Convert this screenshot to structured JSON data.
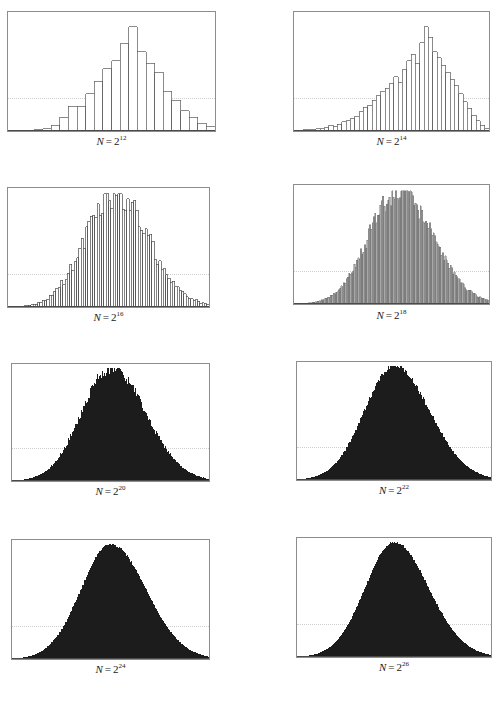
{
  "figure": {
    "type": "multi-panel-histogram-grid",
    "rows": 4,
    "cols": 2,
    "panel_count": 8,
    "background_color": "#ffffff",
    "frame_color": "#8d8d8d",
    "refline_color": "#cfcfcf",
    "refline_style": "dotted"
  },
  "chart_data": [
    {
      "type": "bar",
      "title": "N = 2^12",
      "label_prefix": "N",
      "label_equals": "=",
      "label_base": "2",
      "label_exponent": "12",
      "n_value": 4096,
      "xlabel": "",
      "ylabel": "",
      "grid": false,
      "legend": "none",
      "bar_fill": "#ffffff",
      "bar_stroke": "#5a5a5a",
      "bar_count": 24,
      "refline_y_frac": 0.72,
      "xlim": [
        0,
        24
      ],
      "ylim": [
        0,
        1
      ],
      "categories": [
        "0",
        "1",
        "2",
        "3",
        "4",
        "5",
        "6",
        "7",
        "8",
        "9",
        "10",
        "11",
        "12",
        "13",
        "14",
        "15",
        "16",
        "17",
        "18",
        "19",
        "20",
        "21",
        "22",
        "23"
      ],
      "values": [
        0.0,
        0.0,
        0.0,
        0.01,
        0.02,
        0.05,
        0.12,
        0.22,
        0.22,
        0.33,
        0.44,
        0.55,
        0.62,
        0.77,
        0.92,
        0.7,
        0.6,
        0.52,
        0.35,
        0.27,
        0.18,
        0.12,
        0.07,
        0.04
      ]
    },
    {
      "type": "bar",
      "title": "N = 2^14",
      "label_prefix": "N",
      "label_equals": "=",
      "label_base": "2",
      "label_exponent": "14",
      "n_value": 16384,
      "xlabel": "",
      "ylabel": "",
      "grid": false,
      "legend": "none",
      "bar_fill": "#ffffff",
      "bar_stroke": "#5a5a5a",
      "bar_count": 45,
      "refline_y_frac": 0.72,
      "xlim": [
        0,
        45
      ],
      "ylim": [
        0,
        1
      ],
      "values": [
        0.0,
        0.0,
        0.01,
        0.01,
        0.01,
        0.02,
        0.02,
        0.03,
        0.05,
        0.04,
        0.06,
        0.08,
        0.09,
        0.11,
        0.13,
        0.17,
        0.21,
        0.23,
        0.27,
        0.31,
        0.35,
        0.38,
        0.42,
        0.48,
        0.43,
        0.54,
        0.62,
        0.68,
        0.6,
        0.78,
        0.92,
        0.83,
        0.7,
        0.65,
        0.58,
        0.52,
        0.46,
        0.4,
        0.33,
        0.26,
        0.2,
        0.14,
        0.09,
        0.05,
        0.02
      ]
    },
    {
      "type": "bar",
      "title": "N = 2^16",
      "label_prefix": "N",
      "label_equals": "=",
      "label_base": "2",
      "label_exponent": "16",
      "n_value": 65536,
      "xlabel": "",
      "ylabel": "",
      "grid": false,
      "legend": "none",
      "bar_fill": "#ffffff",
      "bar_stroke": "#4a4a4a",
      "bar_count": 88,
      "refline_y_frac": 0.72,
      "xlim": [
        0,
        88
      ],
      "ylim": [
        0,
        1
      ],
      "distribution": "right-skewed-normal-like",
      "peak_position_frac": 0.52,
      "peak_value": 1.0
    },
    {
      "type": "bar",
      "title": "N = 2^18",
      "label_prefix": "N",
      "label_equals": "=",
      "label_base": "2",
      "label_exponent": "18",
      "n_value": 262144,
      "xlabel": "",
      "ylabel": "",
      "grid": false,
      "legend": "none",
      "bar_fill": "#a8a8a8",
      "bar_stroke": "#6a6a6a",
      "bar_count": 150,
      "refline_y_frac": 0.72,
      "xlim": [
        0,
        150
      ],
      "ylim": [
        0,
        1
      ],
      "distribution": "right-skewed-normal-like",
      "peak_position_frac": 0.53,
      "peak_value": 1.0
    },
    {
      "type": "bar",
      "title": "N = 2^20",
      "label_prefix": "N",
      "label_equals": "=",
      "label_base": "2",
      "label_exponent": "20",
      "n_value": 1048576,
      "xlabel": "",
      "ylabel": "",
      "grid": false,
      "legend": "none",
      "bar_fill": "#1c1c1c",
      "bar_stroke": "#1c1c1c",
      "bar_count": 220,
      "refline_y_frac": 0.72,
      "xlim": [
        0,
        220
      ],
      "ylim": [
        0,
        1
      ],
      "distribution": "normal-with-jagged-peak",
      "peak_position_frac": 0.5,
      "peak_value": 1.0
    },
    {
      "type": "bar",
      "title": "N = 2^22",
      "label_prefix": "N",
      "label_equals": "=",
      "label_base": "2",
      "label_exponent": "22",
      "n_value": 4194304,
      "xlabel": "",
      "ylabel": "",
      "grid": false,
      "legend": "none",
      "bar_fill": "#1c1c1c",
      "bar_stroke": "#1c1c1c",
      "bar_count": 260,
      "refline_y_frac": 0.72,
      "xlim": [
        0,
        260
      ],
      "ylim": [
        0,
        1
      ],
      "distribution": "normal-smooth",
      "peak_position_frac": 0.5,
      "peak_value": 1.0
    },
    {
      "type": "bar",
      "title": "N = 2^24",
      "label_prefix": "N",
      "label_equals": "=",
      "label_base": "2",
      "label_exponent": "24",
      "n_value": 16777216,
      "xlabel": "",
      "ylabel": "",
      "grid": false,
      "legend": "none",
      "bar_fill": "#1c1c1c",
      "bar_stroke": "#1c1c1c",
      "bar_count": 300,
      "refline_y_frac": 0.72,
      "xlim": [
        0,
        300
      ],
      "ylim": [
        0,
        1
      ],
      "distribution": "normal-smooth",
      "peak_position_frac": 0.5,
      "peak_value": 1.0
    },
    {
      "type": "bar",
      "title": "N = 2^26",
      "label_prefix": "N",
      "label_equals": "=",
      "label_base": "2",
      "label_exponent": "26",
      "n_value": 67108864,
      "xlabel": "",
      "ylabel": "",
      "grid": false,
      "legend": "none",
      "bar_fill": "#1c1c1c",
      "bar_stroke": "#1c1c1c",
      "bar_count": 320,
      "refline_y_frac": 0.72,
      "xlim": [
        0,
        320
      ],
      "ylim": [
        0,
        1
      ],
      "distribution": "normal-smooth",
      "peak_position_frac": 0.5,
      "peak_value": 1.0
    }
  ],
  "panels": [
    {
      "x": 7,
      "y": 11,
      "w": 209,
      "h": 121,
      "caption_y": 134
    },
    {
      "x": 293,
      "y": 11,
      "w": 197,
      "h": 121,
      "caption_y": 134
    },
    {
      "x": 7,
      "y": 187,
      "w": 203,
      "h": 121,
      "caption_y": 310
    },
    {
      "x": 293,
      "y": 184,
      "w": 197,
      "h": 121,
      "caption_y": 308
    },
    {
      "x": 11,
      "y": 363,
      "w": 199,
      "h": 119,
      "caption_y": 484
    },
    {
      "x": 296,
      "y": 361,
      "w": 196,
      "h": 120,
      "caption_y": 483
    },
    {
      "x": 11,
      "y": 539,
      "w": 199,
      "h": 121,
      "caption_y": 662
    },
    {
      "x": 296,
      "y": 537,
      "w": 196,
      "h": 121,
      "caption_y": 660
    }
  ]
}
